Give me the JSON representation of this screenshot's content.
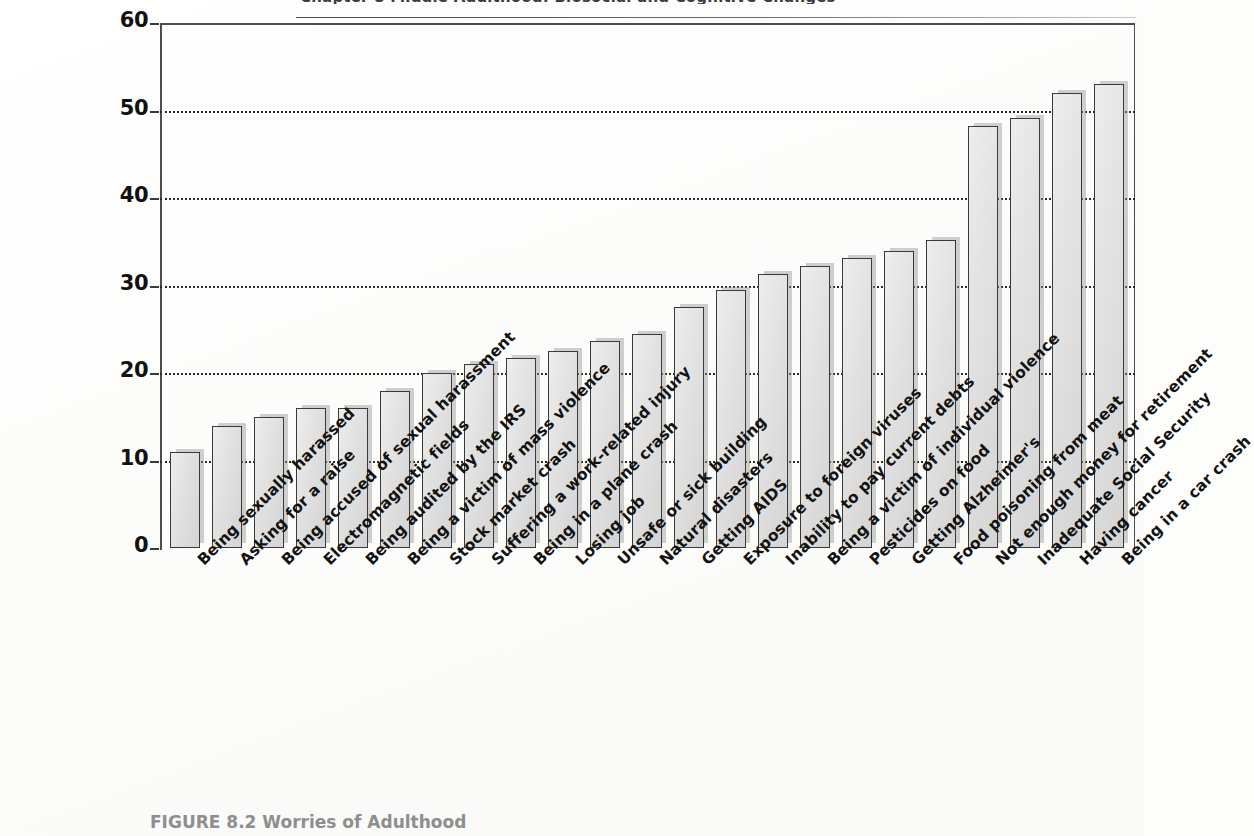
{
  "page": {
    "cut_running_title": "Chapter 8   Middle Adulthood: Biosocial and Cognitive Changes",
    "caption_label": "FIGURE 8.2",
    "caption_text": "Worries of Adulthood"
  },
  "axis": {
    "y_ticks": [
      "0",
      "10",
      "20",
      "30",
      "40",
      "50",
      "60"
    ],
    "y_min": 0,
    "y_max": 60
  },
  "colors": {
    "bar_fill": "#e2e2e2",
    "bar_border": "#3a3a3a",
    "bar_shadow": "#9a9a9a",
    "gridline": "#2b2b2b",
    "frame": "#4d4d4d",
    "caption": "#8e8e8e",
    "text": "#121212"
  },
  "chart_data": {
    "type": "bar",
    "title": "Worries of Adulthood",
    "xlabel": "",
    "ylabel": "",
    "ylim": [
      0,
      60
    ],
    "grid": true,
    "legend": "none",
    "yticks": [
      0,
      10,
      20,
      30,
      40,
      50,
      60
    ],
    "categories": [
      "Being sexually harassed",
      "Asking for a raise",
      "Being accused of sexual harassment",
      "Electromagnetic fields",
      "Being audited by the IRS",
      "Being a victim of mass violence",
      "Stock market crash",
      "Suffering a work-related injury",
      "Being in a plane crash",
      "Losing job",
      "Unsafe or sick building",
      "Natural disasters",
      "Getting AIDS",
      "Exposure to foreign viruses",
      "Inability to pay current debts",
      "Being a victim of individual violence",
      "Pesticides on food",
      "Getting Alzheimer's",
      "Food poisoning from meat",
      "Not enough money for retirement",
      "Inadequate Social Security",
      "Having cancer",
      "Being in a car crash"
    ],
    "values": [
      11,
      14,
      15,
      16,
      16,
      18,
      20,
      21,
      21.7,
      22.5,
      23.7,
      24.5,
      27.5,
      29.5,
      31.3,
      32.2,
      33.2,
      34,
      35.2,
      48.2,
      49.2,
      52,
      53
    ]
  }
}
